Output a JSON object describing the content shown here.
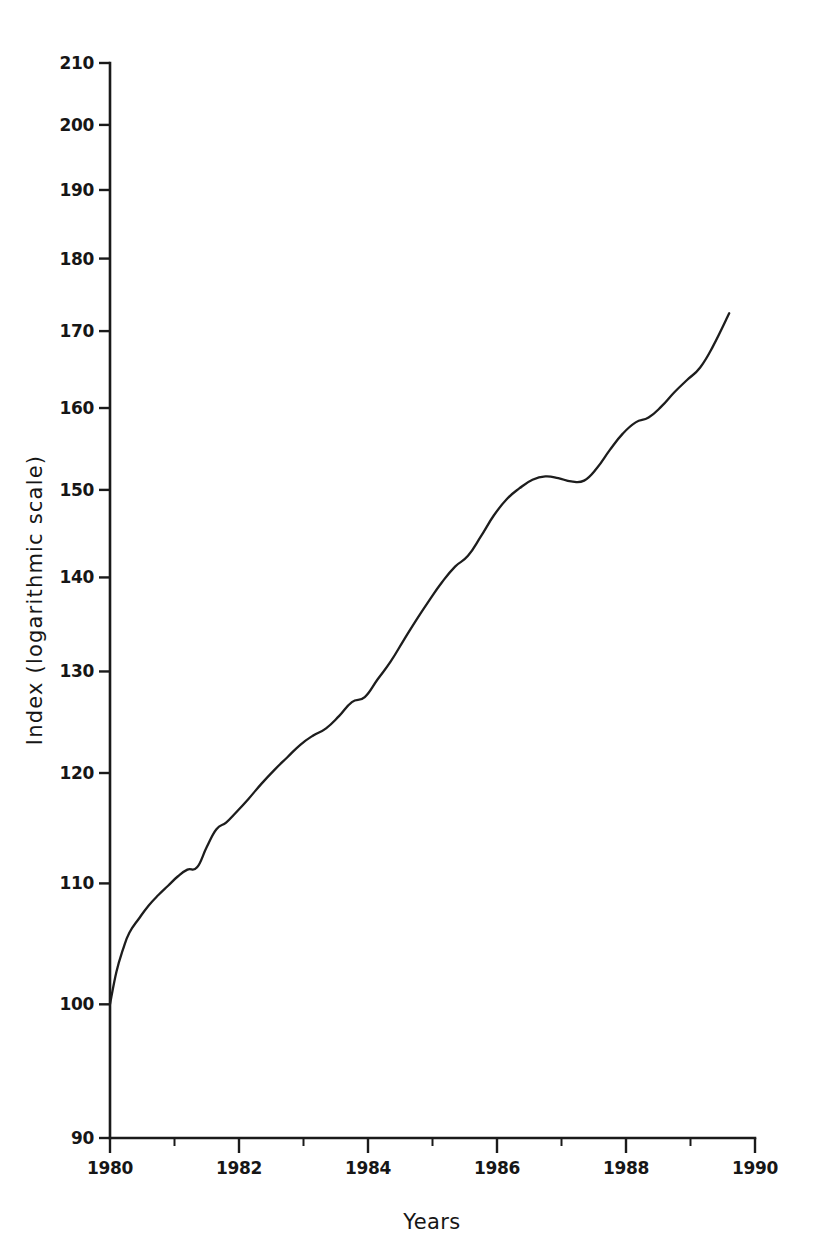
{
  "chart_data": {
    "type": "line",
    "title": "",
    "xlabel": "Years",
    "ylabel": "Index (logarithmic scale)",
    "yscale": "log",
    "xscale": "linear",
    "xlim": [
      1980,
      1990
    ],
    "ylim": [
      90,
      210
    ],
    "grid": false,
    "legend": null,
    "y_ticks": [
      210,
      200,
      190,
      180,
      170,
      160,
      150,
      140,
      130,
      120,
      110,
      100,
      90
    ],
    "y_tick_labels": [
      "210",
      "200",
      "190",
      "180",
      "170",
      "160",
      "150",
      "140",
      "130",
      "120",
      "110",
      "100",
      "90"
    ],
    "x_ticks_major": [
      1980,
      1982,
      1984,
      1986,
      1988,
      1990
    ],
    "x_tick_labels": [
      "1980",
      "1982",
      "1984",
      "1986",
      "1988",
      "1990"
    ],
    "x_ticks_minor": [
      1981,
      1983,
      1985,
      1987,
      1989
    ],
    "line_color": "#1d1d1d",
    "series": [
      {
        "name": "Index",
        "x": [
          1980.0,
          1980.1,
          1980.2,
          1980.3,
          1980.45,
          1980.6,
          1980.75,
          1980.9,
          1981.05,
          1981.2,
          1981.35,
          1981.5,
          1981.65,
          1981.8,
          1981.95,
          1982.15,
          1982.35,
          1982.55,
          1982.75,
          1982.95,
          1983.15,
          1983.35,
          1983.55,
          1983.75,
          1983.95,
          1984.15,
          1984.35,
          1984.55,
          1984.75,
          1984.95,
          1985.15,
          1985.35,
          1985.55,
          1985.75,
          1985.95,
          1986.15,
          1986.35,
          1986.55,
          1986.75,
          1986.95,
          1987.15,
          1987.35,
          1987.55,
          1987.75,
          1987.95,
          1988.15,
          1988.35,
          1988.55,
          1988.75,
          1988.95,
          1989.15,
          1989.35,
          1989.6
        ],
        "y": [
          100.0,
          102.6,
          104.4,
          105.8,
          107.0,
          108.1,
          109.0,
          109.8,
          110.6,
          111.2,
          111.4,
          113.2,
          114.8,
          115.4,
          116.3,
          117.6,
          119.0,
          120.3,
          121.5,
          122.7,
          123.6,
          124.3,
          125.5,
          126.9,
          127.4,
          129.2,
          131.0,
          133.2,
          135.4,
          137.5,
          139.5,
          141.2,
          142.4,
          144.6,
          147.0,
          148.9,
          150.2,
          151.2,
          151.6,
          151.4,
          151.0,
          151.1,
          152.6,
          154.8,
          156.8,
          158.2,
          158.8,
          160.2,
          162.0,
          163.6,
          165.2,
          168.0,
          172.4
        ]
      }
    ],
    "annotations": {
      "start_value": "100",
      "start_year": "1980",
      "end_value": "182",
      "end_year": "1989.6",
      "plateau_value": "151",
      "plateau_years": "1986"
    }
  },
  "labels": {
    "y_axis_title": "Index (logarithmic scale)",
    "x_axis_title": "Years"
  }
}
